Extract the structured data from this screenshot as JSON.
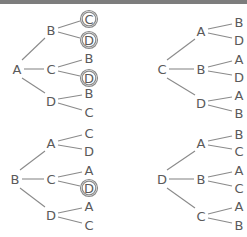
{
  "colors": {
    "text": "#5a5a5a",
    "line": "#8a8a8a",
    "bar": "#7d7d7d"
  },
  "trees": [
    {
      "root": {
        "label": "A",
        "x": 17,
        "y": 69
      },
      "children": [
        {
          "label": "B",
          "x": 51,
          "y": 30,
          "leaves": [
            {
              "label": "C",
              "x": 89,
              "y": 19,
              "circled": true
            },
            {
              "label": "D",
              "x": 89,
              "y": 40,
              "circled": true
            }
          ]
        },
        {
          "label": "C",
          "x": 51,
          "y": 69,
          "leaves": [
            {
              "label": "B",
              "x": 89,
              "y": 58,
              "circled": false
            },
            {
              "label": "D",
              "x": 89,
              "y": 78,
              "circled": true
            }
          ]
        },
        {
          "label": "D",
          "x": 51,
          "y": 101,
          "leaves": [
            {
              "label": "B",
              "x": 89,
              "y": 93,
              "circled": false
            },
            {
              "label": "C",
              "x": 89,
              "y": 112,
              "circled": false
            }
          ]
        }
      ]
    },
    {
      "root": {
        "label": "C",
        "x": 162,
        "y": 69
      },
      "children": [
        {
          "label": "A",
          "x": 201,
          "y": 31,
          "leaves": [
            {
              "label": "B",
              "x": 239,
              "y": 22,
              "circled": false
            },
            {
              "label": "D",
              "x": 239,
              "y": 40,
              "circled": false
            }
          ]
        },
        {
          "label": "B",
          "x": 201,
          "y": 69,
          "leaves": [
            {
              "label": "A",
              "x": 239,
              "y": 59,
              "circled": false
            },
            {
              "label": "D",
              "x": 239,
              "y": 77,
              "circled": false
            }
          ]
        },
        {
          "label": "D",
          "x": 201,
          "y": 103,
          "leaves": [
            {
              "label": "A",
              "x": 239,
              "y": 95,
              "circled": false
            },
            {
              "label": "B",
              "x": 239,
              "y": 113,
              "circled": false
            }
          ]
        }
      ]
    },
    {
      "root": {
        "label": "B",
        "x": 15,
        "y": 179
      },
      "children": [
        {
          "label": "A",
          "x": 51,
          "y": 143,
          "leaves": [
            {
              "label": "C",
              "x": 89,
              "y": 133,
              "circled": false
            },
            {
              "label": "D",
              "x": 89,
              "y": 151,
              "circled": false
            }
          ]
        },
        {
          "label": "C",
          "x": 51,
          "y": 179,
          "leaves": [
            {
              "label": "A",
              "x": 89,
              "y": 170,
              "circled": false
            },
            {
              "label": "D",
              "x": 89,
              "y": 188,
              "circled": true
            }
          ]
        },
        {
          "label": "D",
          "x": 51,
          "y": 215,
          "leaves": [
            {
              "label": "A",
              "x": 89,
              "y": 206,
              "circled": false
            },
            {
              "label": "C",
              "x": 89,
              "y": 225,
              "circled": false
            }
          ]
        }
      ]
    },
    {
      "root": {
        "label": "D",
        "x": 162,
        "y": 179
      },
      "children": [
        {
          "label": "A",
          "x": 201,
          "y": 143,
          "leaves": [
            {
              "label": "B",
              "x": 239,
              "y": 134,
              "circled": false
            },
            {
              "label": "C",
              "x": 239,
              "y": 151,
              "circled": false
            }
          ]
        },
        {
          "label": "B",
          "x": 201,
          "y": 179,
          "leaves": [
            {
              "label": "A",
              "x": 239,
              "y": 170,
              "circled": false
            },
            {
              "label": "C",
              "x": 239,
              "y": 188,
              "circled": false
            }
          ]
        },
        {
          "label": "C",
          "x": 201,
          "y": 216,
          "leaves": [
            {
              "label": "A",
              "x": 239,
              "y": 206,
              "circled": false
            },
            {
              "label": "B",
              "x": 239,
              "y": 225,
              "circled": false
            }
          ]
        }
      ]
    }
  ]
}
